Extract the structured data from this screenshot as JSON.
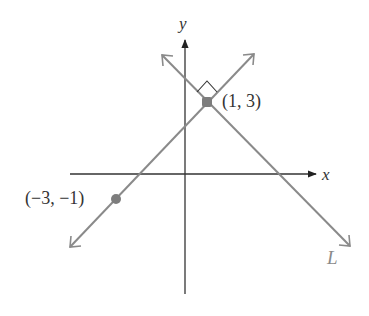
{
  "diagram": {
    "type": "coordinate-plane",
    "axes": {
      "x_label": "x",
      "y_label": "y"
    },
    "points": [
      {
        "label": "(1, 3)",
        "x": 1,
        "y": 3
      },
      {
        "label": "(−3, −1)",
        "x": -3,
        "y": -1
      }
    ],
    "lines": [
      {
        "name": "line-through-points",
        "passes_through": [
          "(-3, -1)",
          "(1, 3)"
        ],
        "slope": 1
      },
      {
        "name": "L",
        "label": "L",
        "passes_through": [
          "(1, 3)"
        ],
        "slope": -1,
        "perpendicular_to": "line-through-points"
      }
    ],
    "annotations": {
      "right_angle_marker": "right-angle at (1, 3)"
    },
    "colors": {
      "line": "#8a8a8a",
      "axis": "#222222",
      "point": "#7d7d7d",
      "text": "#333333"
    }
  }
}
